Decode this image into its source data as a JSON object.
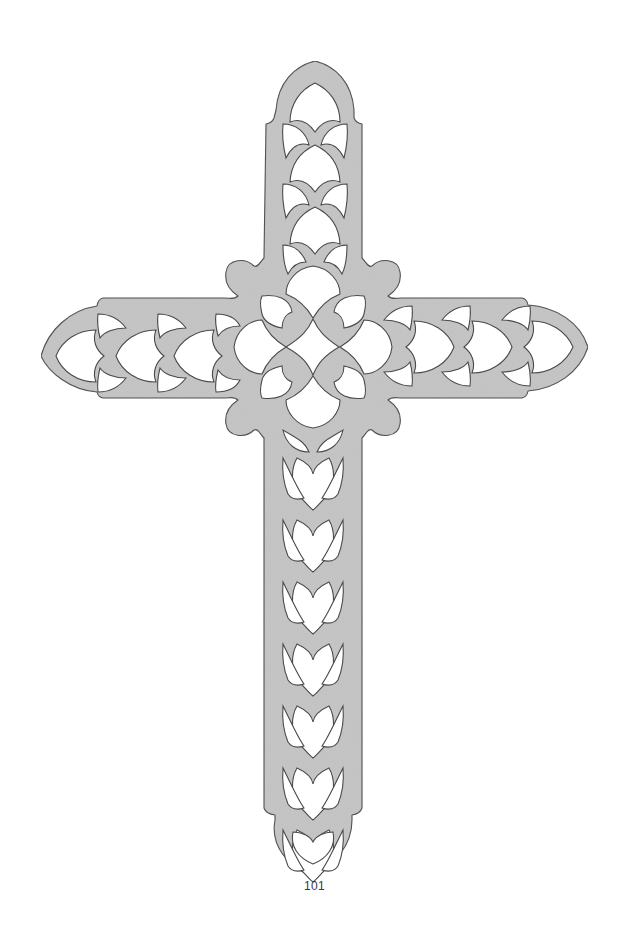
{
  "page": {
    "number": "101",
    "background": "#ffffff"
  },
  "pattern": {
    "subject": "Fretwork cross",
    "fill_color": "#c4c4c4",
    "outline_color": "#4a4a4a",
    "cutout_color": "#ffffff",
    "center": [
      313,
      347
    ],
    "top_tip": [
      315,
      61
    ],
    "bottom_tip": [
      311,
      876
    ],
    "left_tip": [
      41,
      356
    ],
    "right_tip": [
      588,
      347
    ]
  }
}
